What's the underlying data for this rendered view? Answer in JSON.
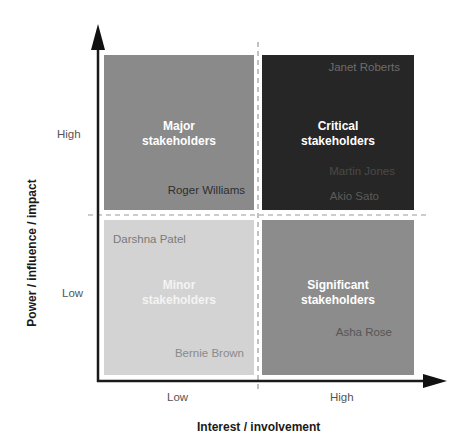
{
  "diagram": {
    "type": "stakeholder-matrix",
    "x_axis": {
      "title": "Interest / involvement",
      "ticks": [
        "Low",
        "High"
      ]
    },
    "y_axis": {
      "title": "Power / influence / impact",
      "ticks": [
        "High",
        "Low"
      ]
    },
    "quadrants": {
      "major": {
        "label_line1": "Major",
        "label_line2": "stakeholders",
        "color": "#8a8a8a",
        "names": [
          "Roger Williams"
        ]
      },
      "critical": {
        "label_line1": "Critical",
        "label_line2": "stakeholders",
        "color": "#262626",
        "names": [
          "Janet Roberts",
          "Martin Jones",
          "Akio Sato"
        ]
      },
      "minor": {
        "label_line1": "Minor",
        "label_line2": "stakeholders",
        "color": "#d3d3d3",
        "names": [
          "Darshna Patel",
          "Bernie Brown"
        ]
      },
      "significant": {
        "label_line1": "Significant",
        "label_line2": "stakeholders",
        "color": "#8c8c8c",
        "names": [
          "Asha Rose"
        ]
      }
    }
  }
}
